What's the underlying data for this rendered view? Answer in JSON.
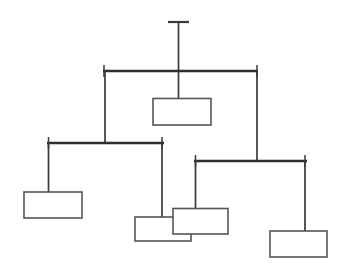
{
  "diagram": {
    "type": "org-chart",
    "canvas": {
      "width": 348,
      "height": 271,
      "background": "#ffffff"
    },
    "colors": {
      "line": "#3a3a3a",
      "bar": "#2e2e2e",
      "box_stroke": "#555555",
      "box_fill": "#ffffff",
      "background": "#ffffff"
    },
    "levels": [
      {
        "name": "root-stub",
        "depth": 0
      },
      {
        "name": "level-1-bar",
        "depth": 1
      },
      {
        "name": "level-2-bars",
        "depth": 2
      },
      {
        "name": "leaf-boxes",
        "depth": 3
      }
    ],
    "root_stub": {
      "name": "root-connector-stub",
      "tick": {
        "x1": 168,
        "y1": 22,
        "x2": 189,
        "y2": 22
      },
      "stem": {
        "x1": 178.5,
        "y1": 22,
        "x2": 178.5,
        "y2": 71
      }
    },
    "bars": [
      {
        "name": "primary-distribution-bar",
        "label": "",
        "y": 71,
        "x1": 103,
        "x2": 258,
        "thickness": 2.4,
        "end_ticks": [
          {
            "x": 104,
            "y1": 65,
            "y2": 77
          },
          {
            "x": 257,
            "y1": 65,
            "y2": 77
          }
        ]
      },
      {
        "name": "left-distribution-bar",
        "label": "",
        "y": 143,
        "x1": 47,
        "x2": 164,
        "thickness": 2.4,
        "end_ticks": [
          {
            "x": 48,
            "y1": 137,
            "y2": 149
          },
          {
            "x": 162,
            "y1": 137,
            "y2": 149
          }
        ]
      },
      {
        "name": "right-distribution-bar",
        "label": "",
        "y": 161,
        "x1": 194,
        "x2": 307,
        "thickness": 2.4,
        "end_ticks": [
          {
            "x": 195,
            "y1": 155,
            "y2": 167
          },
          {
            "x": 305,
            "y1": 155,
            "y2": 167
          }
        ]
      }
    ],
    "connectors": [
      {
        "name": "root-to-primary-bar",
        "x1": 178.5,
        "y1": 22,
        "x2": 178.5,
        "y2": 71
      },
      {
        "name": "primary-bar-to-center-box",
        "x1": 178.5,
        "y1": 71,
        "x2": 178.5,
        "y2": 98
      },
      {
        "name": "primary-bar-to-left-bar",
        "x1": 105,
        "y1": 71,
        "x2": 105,
        "y2": 143
      },
      {
        "name": "primary-bar-to-right-bar",
        "x1": 257,
        "y1": 71,
        "x2": 257,
        "y2": 161
      },
      {
        "name": "left-bar-to-box-a",
        "x1": 48.5,
        "y1": 143,
        "x2": 48.5,
        "y2": 192
      },
      {
        "name": "left-bar-to-box-b",
        "x1": 162,
        "y1": 143,
        "x2": 162,
        "y2": 217
      },
      {
        "name": "right-bar-to-box-c",
        "x1": 195.5,
        "y1": 161,
        "x2": 195.5,
        "y2": 208
      },
      {
        "name": "right-bar-to-box-d",
        "x1": 305,
        "y1": 161,
        "x2": 305,
        "y2": 231
      }
    ],
    "nodes": [
      {
        "name": "center-node",
        "label": "",
        "x": 153,
        "y": 98,
        "width": 58,
        "height": 27,
        "z": 1,
        "parent_bar": "primary-distribution-bar"
      },
      {
        "name": "leaf-node-a",
        "label": "",
        "x": 24,
        "y": 192,
        "width": 58,
        "height": 26,
        "z": 1,
        "parent_bar": "left-distribution-bar"
      },
      {
        "name": "leaf-node-b",
        "label": "",
        "x": 135,
        "y": 217,
        "width": 56,
        "height": 24,
        "z": 1,
        "parent_bar": "left-distribution-bar"
      },
      {
        "name": "leaf-node-c",
        "label": "",
        "x": 173,
        "y": 208,
        "width": 55,
        "height": 26,
        "z": 2,
        "parent_bar": "right-distribution-bar",
        "overlaps": "leaf-node-b"
      },
      {
        "name": "leaf-node-d",
        "label": "",
        "x": 270,
        "y": 231,
        "width": 57,
        "height": 26,
        "z": 1,
        "parent_bar": "right-distribution-bar"
      }
    ],
    "counts": {
      "node_count": 5,
      "bar_count": 3,
      "connector_count": 8
    }
  }
}
